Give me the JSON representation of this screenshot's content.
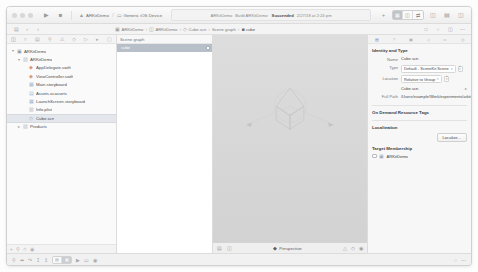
{
  "window": {
    "traffic_lights": [
      "close",
      "minimize",
      "zoom"
    ]
  },
  "toolbar": {
    "run_icon": "play-icon",
    "stop_icon": "stop-icon",
    "scheme_name": "ARKitDemo",
    "scheme_separator": ">",
    "destination": "Generic iOS Device",
    "status_prefix": "ARKitDemo",
    "status_middle": "Build ARKitDemo:",
    "status_strong": "Succeeded",
    "status_date": "2/27/18 at 2:24 pm",
    "editor_modes": [
      "standard-editor",
      "assistant-editor",
      "version-editor"
    ],
    "editor_active_index": 0,
    "panel_toggles": [
      "navigator-toggle",
      "debug-area-toggle",
      "utilities-toggle"
    ],
    "library_icon": "library-icon",
    "plus_icon": "plus-icon"
  },
  "jumpbar": {
    "back_icon": "chevron-left-icon",
    "forward_icon": "chevron-right-icon",
    "crumbs": [
      {
        "label": "ARKitDemo",
        "icon": "project-icon"
      },
      {
        "label": "ARKitDemo",
        "icon": "folder-icon"
      },
      {
        "label": "Cube.scn",
        "icon": "scene-icon"
      },
      {
        "label": "Scene graph",
        "icon": ""
      },
      {
        "label": "cube",
        "icon": "cube-icon"
      }
    ],
    "separator": "›"
  },
  "navigator": {
    "tabs": [
      "project-navigator",
      "source-control-navigator",
      "symbol-navigator",
      "find-navigator",
      "issue-navigator",
      "test-navigator",
      "debug-navigator",
      "breakpoint-navigator",
      "report-navigator"
    ],
    "active_tab_index": 0,
    "filter_placeholder": "Filter",
    "items": [
      {
        "label": "ARKitDemo",
        "depth": 0,
        "icon": "project-icon",
        "twisty": "▾",
        "selected": false
      },
      {
        "label": "ARKitDemo",
        "depth": 1,
        "icon": "folder-icon",
        "twisty": "▾",
        "selected": false
      },
      {
        "label": "AppDelegate.swift",
        "depth": 2,
        "icon": "swift-icon",
        "twisty": "",
        "selected": false
      },
      {
        "label": "ViewController.swift",
        "depth": 2,
        "icon": "swift-icon",
        "twisty": "",
        "selected": false
      },
      {
        "label": "Main.storyboard",
        "depth": 2,
        "icon": "storyboard-icon",
        "twisty": "",
        "selected": false
      },
      {
        "label": "Assets.xcassets",
        "depth": 2,
        "icon": "assets-icon",
        "twisty": "",
        "selected": false
      },
      {
        "label": "LaunchScreen.storyboard",
        "depth": 2,
        "icon": "storyboard-icon",
        "twisty": "",
        "selected": false
      },
      {
        "label": "Info.plist",
        "depth": 2,
        "icon": "plist-icon",
        "twisty": "",
        "selected": false
      },
      {
        "label": "Cube.scn",
        "depth": 2,
        "icon": "scene-icon",
        "twisty": "",
        "selected": true
      },
      {
        "label": "Products",
        "depth": 1,
        "icon": "folder-icon",
        "twisty": "▸",
        "selected": false
      }
    ]
  },
  "scenegraph": {
    "title": "Scene graph",
    "rows": [
      {
        "label": "cube",
        "selected": true
      }
    ]
  },
  "viewport": {
    "camera_label": "Perspective",
    "camera_dot": "◆",
    "footer_left_icons": [
      "grid-icon",
      "snap-icon"
    ],
    "footer_right_icons": [
      "zoom-out-icon",
      "zoom-in-icon",
      "render-icon"
    ]
  },
  "inspector": {
    "tabs": [
      "file-inspector",
      "quick-help-inspector",
      "identity-inspector",
      "attributes-inspector",
      "size-inspector",
      "connections-inspector"
    ],
    "active_tab_index": 0,
    "identity": {
      "title": "Identity and Type",
      "name_label": "Name",
      "name_value": "Cube.scn",
      "type_label": "Type",
      "type_value": "Default - SceneKit Scene",
      "location_label": "Location",
      "location_value": "Relative to Group",
      "location_file": "Cube.scn",
      "fullpath_label": "Full Path",
      "fullpath_value": "/Users/example/Work/experiments/arkitdemo/ARKitDemo/ARKitDemo/Cube.scn"
    },
    "ondemand": {
      "title": "On Demand Resource Tags"
    },
    "localization": {
      "title": "Localization",
      "button_label": "Localize..."
    },
    "target_membership": {
      "title": "Target Membership",
      "targets": [
        {
          "label": "ARKitDemo",
          "checked": false
        }
      ]
    }
  },
  "statusbar": {
    "left_icons": [
      "filter-icon",
      "breakpoint-icon",
      "step-icon",
      "continue-icon"
    ],
    "right_icons": [
      "console-icon",
      "variables-icon"
    ]
  }
}
